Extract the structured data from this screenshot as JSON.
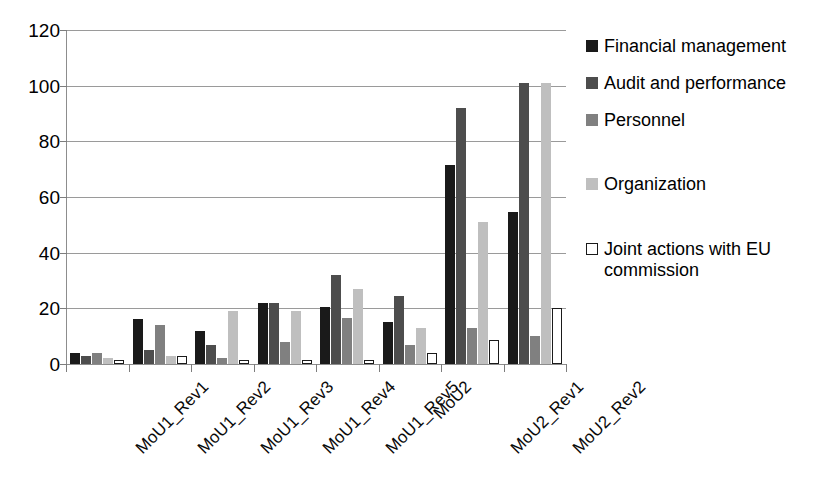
{
  "chart_data": {
    "type": "bar",
    "title": "",
    "xlabel": "",
    "ylabel": "",
    "ylim": [
      0,
      120
    ],
    "yticks": [
      0,
      20,
      40,
      60,
      80,
      100,
      120
    ],
    "grid": true,
    "legend_position": "right",
    "categories": [
      "MoU1_Rev1",
      "MoU1_Rev2",
      "MoU1_Rev3",
      "MoU1_Rev4",
      "MoU1_Rev5",
      "MoU2",
      "MoU2_Rev1",
      "MoU2_Rev2"
    ],
    "series": [
      {
        "name": "Financial management",
        "color": "#1a1a1a",
        "values": [
          4,
          16,
          12,
          22,
          20.5,
          15,
          71.5,
          54.5
        ]
      },
      {
        "name": "Audit and performance",
        "color": "#4d4d4d",
        "values": [
          3,
          5,
          7,
          22,
          32,
          24.5,
          92,
          101
        ]
      },
      {
        "name": "Personnel",
        "color": "#808080",
        "values": [
          4,
          14,
          2,
          8,
          16.5,
          7,
          13,
          10
        ]
      },
      {
        "name": "Organization",
        "color": "#bfbfbf",
        "values": [
          2,
          3,
          19,
          19,
          27,
          13,
          51,
          101
        ]
      },
      {
        "name": "Joint actions with EU commission",
        "color": "#ffffff",
        "values": [
          1.5,
          3,
          1.5,
          1.5,
          1.5,
          4,
          8.5,
          20
        ]
      }
    ]
  },
  "legend": {
    "items": [
      {
        "label": "Financial management",
        "swatch": "#1a1a1a",
        "outlined": false
      },
      {
        "label": "Audit and performance",
        "swatch": "#4d4d4d",
        "outlined": false
      },
      {
        "label": "Personnel",
        "swatch": "#808080",
        "outlined": false
      },
      {
        "label": "Organization",
        "swatch": "#bfbfbf",
        "outlined": false
      },
      {
        "label": "Joint actions with EU commission",
        "swatch": "#ffffff",
        "outlined": true
      }
    ]
  },
  "axes": {
    "y_tick_labels": [
      "120",
      "100",
      "80",
      "60",
      "40",
      "20",
      "0"
    ],
    "x_tick_labels": [
      "MoU1_Rev1",
      "MoU1_Rev2",
      "MoU1_Rev3",
      "MoU1_Rev4",
      "MoU1_Rev5",
      "MoU2",
      "MoU2_Rev1",
      "MoU2_Rev2"
    ]
  },
  "colors": {
    "grid": "#9a9a9a",
    "axis": "#8d8d8d",
    "text": "#000000",
    "background": "#ffffff"
  }
}
